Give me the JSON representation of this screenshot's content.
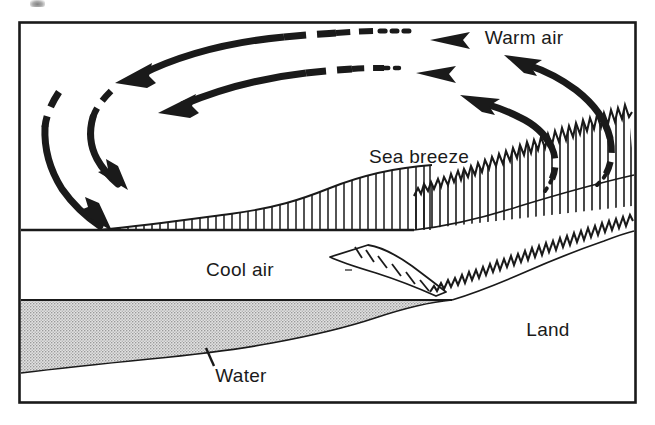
{
  "figure": {
    "kind": "cross-section-diagram",
    "frame": {
      "border_color": "#1a1a1a",
      "background": "#ffffff"
    },
    "ink_color": "#1a1a1a",
    "water_fill_color": "#c8c8c8"
  },
  "labels": [
    {
      "id": "warm-air",
      "text": "Warm air",
      "x": 524,
      "y": 44,
      "anchor": "middle"
    },
    {
      "id": "sea-breeze",
      "text": "Sea breeze",
      "x": 419,
      "y": 163,
      "anchor": "middle"
    },
    {
      "id": "cool-air",
      "text": "Cool air",
      "x": 240,
      "y": 276,
      "anchor": "middle"
    },
    {
      "id": "land",
      "text": "Land",
      "x": 548,
      "y": 336,
      "anchor": "middle"
    },
    {
      "id": "water",
      "text": "Water",
      "x": 241,
      "y": 382,
      "anchor": "middle"
    }
  ],
  "regions": [
    {
      "id": "warm-air-region",
      "name": "warm air layer aloft"
    },
    {
      "id": "sea-breeze-layer",
      "name": "hatched sea breeze inflow layer"
    },
    {
      "id": "cool-air-region",
      "name": "cool air over water"
    },
    {
      "id": "water-region",
      "name": "stippled water body"
    },
    {
      "id": "land-region",
      "name": "sloping land surface"
    }
  ],
  "arrows": [
    {
      "id": "upper-return-flow",
      "direction": "leftward-aloft",
      "style": "dashed-to-dotted",
      "note": "return flow at top of cell, arrowhead to the left"
    },
    {
      "id": "lower-return-flow",
      "direction": "leftward-aloft",
      "style": "dashed-to-dotted",
      "note": "inner return flow, arrowhead to the left"
    },
    {
      "id": "outer-descent",
      "direction": "downward-seaward",
      "style": "solid-to-dashed",
      "note": "outer subsiding branch over water"
    },
    {
      "id": "inner-descent",
      "direction": "downward-seaward",
      "style": "solid-to-dashed",
      "note": "inner subsiding branch over water"
    },
    {
      "id": "outer-ascent",
      "direction": "upward-landward",
      "style": "solid-to-dotted",
      "note": "outer rising branch over land"
    },
    {
      "id": "inner-ascent",
      "direction": "upward-landward",
      "style": "solid-to-dotted",
      "note": "inner rising branch over land"
    },
    {
      "id": "cool-air-wedge",
      "direction": "downslope-right",
      "style": "open-outline",
      "note": "cool air wedge advancing toward land"
    }
  ],
  "leader_lines": [
    {
      "id": "water-leader",
      "from_label": "water",
      "note": "short tick from Water label to water surface"
    }
  ]
}
